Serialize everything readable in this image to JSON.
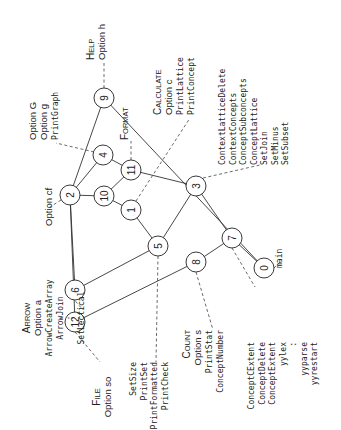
{
  "diagram": {
    "nodes": [
      {
        "id": "0",
        "label": "0"
      },
      {
        "id": "1",
        "label": "1"
      },
      {
        "id": "2",
        "label": "2"
      },
      {
        "id": "3",
        "label": "3"
      },
      {
        "id": "4",
        "label": "4"
      },
      {
        "id": "5",
        "label": "5"
      },
      {
        "id": "6",
        "label": "6"
      },
      {
        "id": "7",
        "label": "7"
      },
      {
        "id": "8",
        "label": "8"
      },
      {
        "id": "9",
        "label": "9"
      },
      {
        "id": "10",
        "label": "10"
      },
      {
        "id": "11",
        "label": "11"
      },
      {
        "id": "12",
        "label": "12"
      }
    ],
    "edges": [
      [
        "2",
        "9"
      ],
      [
        "2",
        "4"
      ],
      [
        "2",
        "10"
      ],
      [
        "2",
        "6"
      ],
      [
        "2",
        "12"
      ],
      [
        "4",
        "11"
      ],
      [
        "10",
        "11"
      ],
      [
        "10",
        "1"
      ],
      [
        "1",
        "5"
      ],
      [
        "6",
        "5"
      ],
      [
        "11",
        "3"
      ],
      [
        "9",
        "0"
      ],
      [
        "5",
        "3"
      ],
      [
        "12",
        "8"
      ],
      [
        "3",
        "7"
      ],
      [
        "8",
        "7"
      ],
      [
        "7",
        "0"
      ]
    ],
    "annotations": {
      "help": {
        "node": "9",
        "caps": "Help",
        "lines": [
          "Option h"
        ],
        "mono": []
      },
      "format": {
        "node": "11",
        "caps": "Format",
        "lines": [],
        "mono": []
      },
      "graph": {
        "node": "4",
        "caps": "",
        "lines": [
          "Option G",
          "Option g"
        ],
        "mono": [
          "PrintGraph"
        ]
      },
      "calculate": {
        "node": "1",
        "caps": "Calculate",
        "lines": [
          "Option c"
        ],
        "mono": [
          "PrintLattice",
          "PrintConcept"
        ]
      },
      "context": {
        "node": "3",
        "caps": "",
        "lines": [],
        "mono": [
          "ContextLatticeDelete",
          "ContextConcepts",
          "ConceptSubconcepts",
          "ConceptLattice",
          "SetJoin",
          "SetMinus",
          "SetSubset"
        ]
      },
      "main": {
        "node": "0",
        "caps": "",
        "lines": [],
        "mono": [
          "main"
        ]
      },
      "optioncf": {
        "node": "2",
        "caps": "",
        "lines": [
          "Option cf"
        ],
        "mono": []
      },
      "arrow": {
        "node": "6",
        "caps": "Arrow",
        "lines": [
          "Option a"
        ],
        "mono": [
          "ArrowCreateArray",
          "ArrowJoin",
          ":",
          "SetLectical"
        ]
      },
      "file": {
        "node": "12",
        "caps": "File",
        "lines": [
          "Option so"
        ],
        "mono": []
      },
      "print": {
        "node": "5",
        "caps": "",
        "lines": [],
        "mono": [
          "SetSize",
          "PrintSet",
          "PrintFormatted",
          "PrintCheck"
        ]
      },
      "count": {
        "node": "8",
        "caps": "Count",
        "lines": [
          "Option s"
        ],
        "mono": [
          "PrintStat",
          "ConceptNumber"
        ]
      },
      "extent": {
        "node": "7",
        "caps": "",
        "lines": [],
        "mono": [
          "ConceptCExtent",
          "ConceptDelete",
          "ConceptExtent",
          "yylex",
          ":",
          "yyparse",
          "yyrestart"
        ]
      }
    }
  }
}
